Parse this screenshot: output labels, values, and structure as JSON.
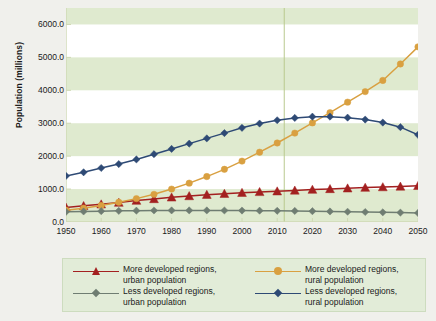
{
  "chart_data": {
    "type": "line",
    "title": "",
    "xlabel": "",
    "ylabel": "Population (millions)",
    "xlim": [
      1950,
      2050
    ],
    "ylim": [
      0,
      6500
    ],
    "ytick_values": [
      0,
      1000,
      2000,
      3000,
      4000,
      5000,
      6000
    ],
    "ytick_labels": [
      "0.0",
      "1000.0",
      "2000.0",
      "3000.0",
      "4000.0",
      "5000.0",
      "6000.0"
    ],
    "xtick_labels": [
      "1950",
      "1960",
      "1970",
      "1980",
      "1990",
      "2000",
      "2010",
      "2020",
      "2030",
      "2040",
      "2050"
    ],
    "x": [
      1950,
      1955,
      1960,
      1965,
      1970,
      1975,
      1980,
      1985,
      1990,
      1995,
      2000,
      2005,
      2010,
      2015,
      2020,
      2025,
      2030,
      2035,
      2040,
      2045,
      2050
    ],
    "grid": "horizontal-bands",
    "legend_position": "below",
    "reference_line": {
      "x": 2012,
      "color": "#b9c98f"
    },
    "series": [
      {
        "name": "More developed regions, urban population",
        "label_line1": "More developed regions,",
        "label_line2": "urban population",
        "color": "#a32020",
        "marker": "triangle",
        "values": [
          440,
          490,
          540,
          590,
          650,
          700,
          750,
          790,
          830,
          860,
          890,
          915,
          935,
          960,
          985,
          1005,
          1025,
          1045,
          1062,
          1080,
          1100
        ]
      },
      {
        "name": "More developed regions, rural population",
        "label_line1": "More developed regions,",
        "label_line2": "rural population",
        "color": "#d9a041",
        "marker": "circle",
        "values": [
          360,
          420,
          500,
          600,
          710,
          840,
          1000,
          1180,
          1380,
          1600,
          1850,
          2120,
          2400,
          2700,
          3010,
          3320,
          3640,
          3960,
          4300,
          4800,
          5320
        ]
      },
      {
        "name": "Less developed regions, urban population",
        "label_line1": "Less developed regions,",
        "label_line2": "urban population",
        "color": "#6f7d72",
        "marker": "diamond",
        "values": [
          310,
          320,
          330,
          338,
          345,
          350,
          352,
          353,
          352,
          350,
          348,
          345,
          340,
          335,
          328,
          320,
          312,
          303,
          294,
          285,
          275
        ]
      },
      {
        "name": "Less developed regions, rural population",
        "label_line1": "Less developed regions,",
        "label_line2": "rural population",
        "color": "#2e4a75",
        "marker": "diamond",
        "values": [
          1400,
          1510,
          1640,
          1760,
          1900,
          2060,
          2220,
          2380,
          2540,
          2700,
          2860,
          2990,
          3090,
          3160,
          3200,
          3200,
          3170,
          3110,
          3020,
          2880,
          2650
        ]
      }
    ]
  }
}
